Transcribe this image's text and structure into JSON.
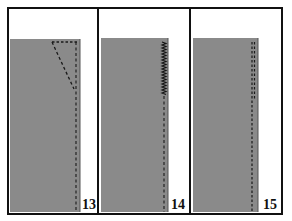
{
  "figure": {
    "colors": {
      "frame": "#111111",
      "fabric": "#8a8a8a",
      "background": "#ffffff",
      "stitch": "#1a1a1a"
    },
    "panels": [
      {
        "step": "13",
        "stitch_type": "dashed-dart-triangle"
      },
      {
        "step": "14",
        "stitch_type": "zigzag-then-dashed"
      },
      {
        "step": "15",
        "stitch_type": "double-dashed"
      }
    ]
  }
}
